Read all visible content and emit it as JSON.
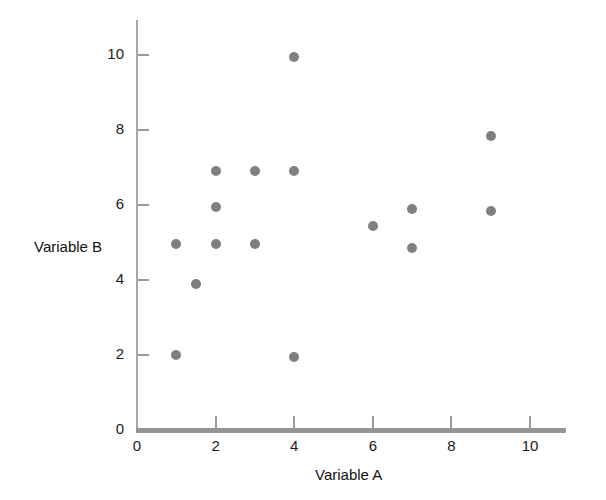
{
  "chart_data": {
    "type": "scatter",
    "title": "",
    "xlabel": "Variable A",
    "ylabel": "Variable B",
    "xlim": [
      0,
      11
    ],
    "ylim": [
      0,
      10.5
    ],
    "xticks": [
      0,
      2,
      4,
      6,
      8,
      10
    ],
    "xtick_labels": [
      "0",
      "2",
      "4",
      "6",
      "8",
      "10"
    ],
    "yticks": [
      0,
      2,
      4,
      6,
      8,
      10
    ],
    "ytick_labels": [
      "0",
      "2",
      "4",
      "6",
      "8",
      "10"
    ],
    "grid": false,
    "legend": false,
    "marker": "circle",
    "marker_color": "#7f7f7f",
    "marker_size": 10,
    "points": [
      {
        "x": 1,
        "y": 2.0
      },
      {
        "x": 1,
        "y": 4.95
      },
      {
        "x": 1.5,
        "y": 3.9
      },
      {
        "x": 2,
        "y": 4.95
      },
      {
        "x": 2,
        "y": 5.95
      },
      {
        "x": 2,
        "y": 6.9
      },
      {
        "x": 3,
        "y": 4.95
      },
      {
        "x": 3,
        "y": 6.9
      },
      {
        "x": 4,
        "y": 1.95
      },
      {
        "x": 4,
        "y": 6.9
      },
      {
        "x": 4,
        "y": 9.95
      },
      {
        "x": 6,
        "y": 5.45
      },
      {
        "x": 7,
        "y": 4.85
      },
      {
        "x": 7,
        "y": 5.9
      },
      {
        "x": 9,
        "y": 5.85
      },
      {
        "x": 9,
        "y": 7.85
      }
    ]
  },
  "axes": {
    "x_axis_color": "#949494",
    "y_axis_color": "#a8a8a8"
  }
}
